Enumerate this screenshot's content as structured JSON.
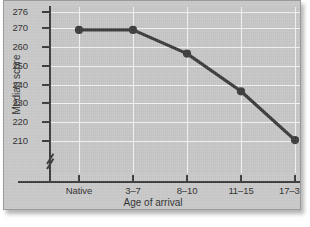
{
  "chart_data": {
    "type": "line",
    "title": "",
    "subtitle": "",
    "xlabel": "Age of arrival",
    "ylabel": "Median score",
    "categories": [
      "Native",
      "3–7",
      "8–10",
      "11–15",
      "17–39"
    ],
    "values": [
      269,
      269,
      256.5,
      236.5,
      210.5
    ],
    "series": [
      {
        "name": "Median score",
        "values": [
          269,
          269,
          256.5,
          236.5,
          210.5
        ]
      }
    ],
    "y_ticks": [
      276,
      270,
      260,
      250,
      240,
      230,
      220,
      210
    ],
    "y_tick_labels": [
      "276",
      "270",
      "260",
      "250",
      "240",
      "230",
      "220",
      "210"
    ],
    "x_tick_labels": [
      "Native",
      "3–7",
      "8–10",
      "11–15",
      "17–39"
    ],
    "ylim": [
      205,
      276
    ],
    "axis_break": true,
    "grid": true,
    "legend": "none",
    "marker": "circle",
    "colors": {
      "line": "#3b3b3b",
      "marker": "#3b3b3b",
      "plot_background": "#c6c6c6",
      "panel_background": "#c9c9c9",
      "gridline": "#f2f2f2",
      "axis": "#3b3b3b",
      "text": "#2f2f2f"
    }
  },
  "figure": {
    "axis_title_x": "Age of arrival",
    "axis_title_y": "Median score"
  }
}
